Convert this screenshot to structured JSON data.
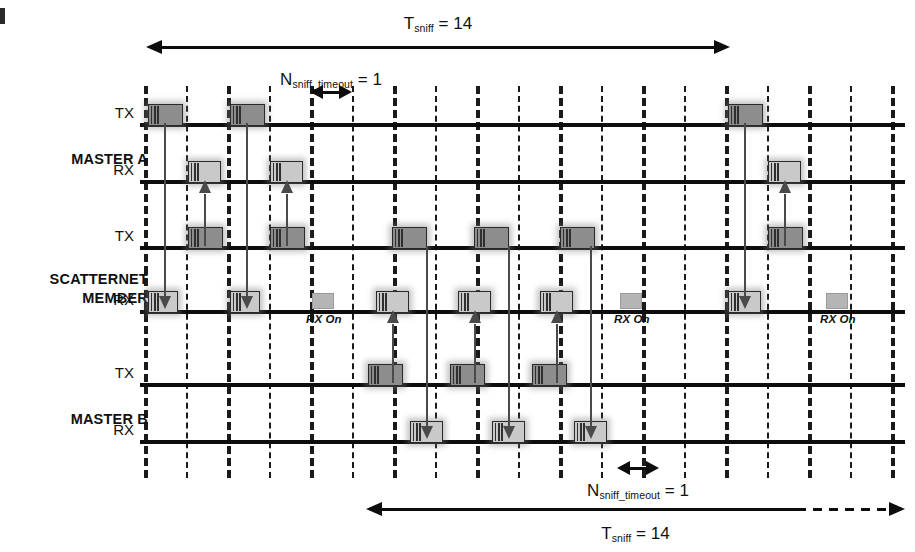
{
  "diagram": {
    "grid": {
      "count": 19,
      "x0": 144,
      "step": 41.5,
      "top": 86,
      "bottom": 478
    },
    "colors": {
      "tx_fill": "#8d8d8d",
      "rx_fill": "#c9c9c9",
      "rx_on_fill": "#b5b5b5",
      "line": "#0d0d0d",
      "arrow": "#4a4a4a"
    }
  },
  "groups": [
    {
      "name": "MASTER A",
      "label": "MASTER A",
      "rows": [
        "TX",
        "RX"
      ]
    },
    {
      "name": "SCATTERNET MEMBER",
      "label_line1": "SCATTERNET",
      "label_line2": "MEMBER",
      "rows": [
        "TX",
        "RX"
      ]
    },
    {
      "name": "MASTER B",
      "label": "MASTER B",
      "rows": [
        "TX",
        "RX"
      ]
    }
  ],
  "rows": [
    {
      "id": "master-a-tx",
      "label": "TX",
      "y": 123,
      "kind": "tx",
      "packets": [
        {
          "x": 148,
          "w": 35
        },
        {
          "x": 230,
          "w": 35
        },
        {
          "x": 728,
          "w": 35
        }
      ]
    },
    {
      "id": "master-a-rx",
      "label": "RX",
      "y": 180,
      "kind": "rx",
      "packets": [
        {
          "x": 188,
          "w": 33
        },
        {
          "x": 270,
          "w": 33
        },
        {
          "x": 768,
          "w": 33
        }
      ]
    },
    {
      "id": "scatternet-tx",
      "label": "TX",
      "y": 246,
      "kind": "tx",
      "packets": [
        {
          "x": 188,
          "w": 35
        },
        {
          "x": 270,
          "w": 35
        },
        {
          "x": 392,
          "w": 35
        },
        {
          "x": 474,
          "w": 35
        },
        {
          "x": 560,
          "w": 35
        },
        {
          "x": 768,
          "w": 35
        }
      ]
    },
    {
      "id": "scatternet-rx",
      "label": "RX",
      "y": 310,
      "kind": "rx",
      "packets": [
        {
          "x": 148,
          "w": 30
        },
        {
          "x": 230,
          "w": 30
        },
        {
          "x": 376,
          "w": 33
        },
        {
          "x": 458,
          "w": 33
        },
        {
          "x": 540,
          "w": 33
        },
        {
          "x": 728,
          "w": 33
        }
      ],
      "rx_on_blocks": [
        {
          "x": 312,
          "w": 22
        },
        {
          "x": 620,
          "w": 22
        },
        {
          "x": 826,
          "w": 22
        }
      ],
      "rx_on_labels": [
        {
          "x": 306,
          "text": "RX On"
        },
        {
          "x": 614,
          "text": "RX On"
        },
        {
          "x": 820,
          "text": "RX On"
        }
      ]
    },
    {
      "id": "master-b-tx",
      "label": "TX",
      "y": 383,
      "kind": "tx",
      "packets": [
        {
          "x": 368,
          "w": 35
        },
        {
          "x": 450,
          "w": 35
        },
        {
          "x": 532,
          "w": 35
        }
      ]
    },
    {
      "id": "master-b-rx",
      "label": "RX",
      "y": 440,
      "kind": "rx",
      "packets": [
        {
          "x": 410,
          "w": 33
        },
        {
          "x": 492,
          "w": 33
        },
        {
          "x": 574,
          "w": 33
        }
      ]
    }
  ],
  "connectors": [
    {
      "from": "master-a-tx",
      "to": "scatternet-rx",
      "x": 164,
      "dir": "down"
    },
    {
      "from": "master-a-tx",
      "to": "scatternet-rx",
      "x": 246,
      "dir": "down"
    },
    {
      "from": "scatternet-tx",
      "to": "master-a-rx",
      "x": 204,
      "dir": "up"
    },
    {
      "from": "scatternet-tx",
      "to": "master-a-rx",
      "x": 286,
      "dir": "up"
    },
    {
      "from": "scatternet-tx",
      "to": "master-a-rx",
      "x": 784,
      "dir": "up-right"
    },
    {
      "from": "master-a-tx",
      "to": "scatternet-rx",
      "x": 744,
      "dir": "down"
    },
    {
      "from": "master-b-tx",
      "to": "scatternet-rx",
      "x": 392,
      "dir": "up-b"
    },
    {
      "from": "master-b-tx",
      "to": "scatternet-rx",
      "x": 474,
      "dir": "up-b"
    },
    {
      "from": "master-b-tx",
      "to": "scatternet-rx",
      "x": 556,
      "dir": "up-b"
    },
    {
      "from": "scatternet-tx",
      "to": "master-b-rx",
      "x": 426,
      "dir": "down-b"
    },
    {
      "from": "scatternet-tx",
      "to": "master-b-rx",
      "x": 508,
      "dir": "down-b"
    },
    {
      "from": "scatternet-tx",
      "to": "master-b-rx",
      "x": 590,
      "dir": "down-b"
    }
  ],
  "annotations": {
    "tsniff_top": {
      "text_main": "T",
      "text_sub": "sniff",
      "text_tail": " = 14",
      "x1": 146,
      "x2": 730,
      "y_arrow": 47,
      "y_label": 14
    },
    "tsniff_bottom": {
      "text_main": "T",
      "text_sub": "sniff",
      "text_tail": " = 14",
      "x1": 366,
      "x2": 905,
      "y_arrow": 509,
      "y_label": 524
    },
    "nsniff_top": {
      "text_main": "N",
      "text_sub": "sniff_timeout",
      "text_tail": " = 1",
      "x1": 310,
      "x2": 352,
      "y_arrow": 92,
      "y_label": 70
    },
    "nsniff_bottom": {
      "text_main": "N",
      "text_sub": "sniff_timeout",
      "text_tail": " = 1",
      "x1": 617,
      "x2": 659,
      "y_arrow": 468,
      "y_label": 481
    }
  }
}
